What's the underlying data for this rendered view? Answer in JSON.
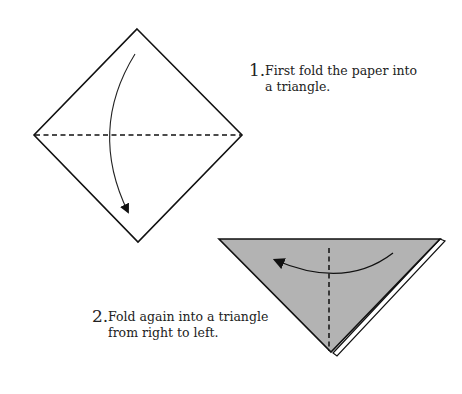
{
  "steps": [
    {
      "number": "1.",
      "lines": [
        "First fold the paper into",
        "a triangle."
      ]
    },
    {
      "number": "2.",
      "lines": [
        "Fold again into a triangle",
        "from right to left."
      ]
    }
  ],
  "colors": {
    "line": "#111111",
    "paper_fill": "#ffffff",
    "folded_fill": "#b3b3b3"
  },
  "diagrams": [
    {
      "id": "step1",
      "shape": "square-diamond",
      "fold_line": "horizontal-dashed",
      "arrow": "top-to-bottom-curved"
    },
    {
      "id": "step2",
      "shape": "triangle",
      "fold_line": "vertical-dashed",
      "arrow": "right-to-left-curved"
    }
  ]
}
